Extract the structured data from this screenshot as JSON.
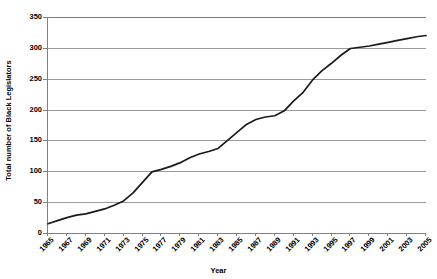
{
  "chart_data": {
    "type": "line",
    "title": "",
    "xlabel": "Year",
    "ylabel": "Total number of Black Legislators",
    "xlim": [
      1965,
      2005
    ],
    "ylim": [
      0,
      350
    ],
    "grid": true,
    "legend_position": "none",
    "line_color": "#1a1a1a",
    "axis_color": "#808080",
    "gridline_color": "#9a9a9a",
    "background_color": "#ffffff",
    "y_ticks": [
      0,
      50,
      100,
      150,
      200,
      250,
      300,
      350
    ],
    "y_tick_labels": [
      "0",
      "50",
      "100",
      "150",
      "200",
      "250",
      "300",
      "350"
    ],
    "x_tick_labels": [
      "1965",
      "1967",
      "1969",
      "1971",
      "1973",
      "1975",
      "1977",
      "1979",
      "1981",
      "1983",
      "1985",
      "1987",
      "1989",
      "1991",
      "1993",
      "1995",
      "1997",
      "1999",
      "2001",
      "2003",
      "2005"
    ],
    "x": [
      1965,
      1966,
      1967,
      1968,
      1969,
      1970,
      1971,
      1972,
      1973,
      1974,
      1975,
      1976,
      1977,
      1978,
      1979,
      1980,
      1981,
      1982,
      1983,
      1984,
      1985,
      1986,
      1987,
      1988,
      1989,
      1990,
      1991,
      1992,
      1993,
      1994,
      1995,
      1996,
      1997,
      1998,
      1999,
      2000,
      2001,
      2002,
      2003,
      2004,
      2005
    ],
    "values": [
      15,
      20,
      25,
      29,
      31,
      35,
      39,
      45,
      52,
      65,
      82,
      99,
      103,
      108,
      114,
      122,
      128,
      132,
      137,
      150,
      163,
      176,
      184,
      188,
      190,
      198,
      214,
      228,
      248,
      263,
      275,
      288,
      299,
      301,
      303,
      306,
      309,
      312,
      315,
      318,
      320
    ],
    "series": [
      {
        "name": "Total number of Black Legislators",
        "values": [
          15,
          20,
          25,
          29,
          31,
          35,
          39,
          45,
          52,
          65,
          82,
          99,
          103,
          108,
          114,
          122,
          128,
          132,
          137,
          150,
          163,
          176,
          184,
          188,
          190,
          198,
          214,
          228,
          248,
          263,
          275,
          288,
          299,
          301,
          303,
          306,
          309,
          312,
          315,
          318,
          320
        ]
      }
    ]
  }
}
